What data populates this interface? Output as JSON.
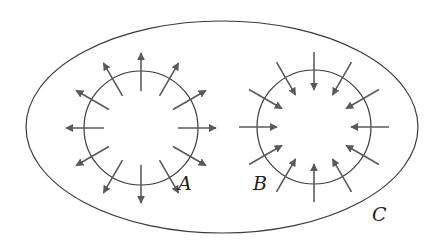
{
  "diagram": {
    "colors": {
      "outline": "#3a3a3a",
      "arrow": "#5a5a5a",
      "background": "#ffffff"
    },
    "outer_region": {
      "label": "C",
      "cx": 222,
      "cy": 127,
      "rx": 196,
      "ry": 106,
      "label_x": 372,
      "label_y": 221
    },
    "circles": [
      {
        "id": "A",
        "label": "A",
        "cx": 141,
        "cy": 128,
        "r": 57,
        "direction": "outward",
        "arrow_count": 12,
        "label_x": 178,
        "label_y": 190
      },
      {
        "id": "B",
        "label": "B",
        "cx": 314,
        "cy": 127,
        "r": 57,
        "direction": "inward",
        "arrow_count": 12,
        "label_x": 253,
        "label_y": 190
      }
    ],
    "arrow": {
      "inner_offset": -20,
      "outer_offset": 18
    }
  }
}
